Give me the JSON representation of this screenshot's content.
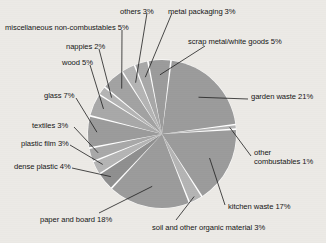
{
  "background_color": "#eceae6",
  "chart_data": {
    "type": "pie",
    "title": "",
    "center": {
      "x": 162,
      "y": 134
    },
    "radius": 74,
    "start_angle_deg": -83,
    "direction": "clockwise",
    "separator_color": "#ffffff",
    "legend": "none (direct labels with leader lines)",
    "categories": [
      "garden waste",
      "other combustables",
      "kitchen waste",
      "soil and other organic material",
      "paper and board",
      "dense plastic",
      "plastic film",
      "textiles",
      "glass",
      "wood",
      "nappies",
      "miscellaneous non-combustables",
      "others",
      "metal packaging",
      "scrap metal/white goods"
    ],
    "values": [
      21,
      1,
      17,
      3,
      18,
      4,
      3,
      3,
      7,
      5,
      2,
      5,
      3,
      3,
      5
    ],
    "units": "%",
    "slice_colors": [
      "#9b9b9b",
      "#b4b4b4",
      "#9b9b9b",
      "#b4b4b4",
      "#9b9b9b",
      "#8f8f8f",
      "#b4b4b4",
      "#a8a8a8",
      "#9b9b9b",
      "#a8a8a8",
      "#b4b4b4",
      "#a2a2a2",
      "#b4b4b4",
      "#a8a8a8",
      "#9b9b9b"
    ],
    "labels": [
      {
        "key": "others",
        "text": "others 3%"
      },
      {
        "key": "metal_packaging",
        "text": "metal packaging 3%"
      },
      {
        "key": "misc_non_combustables",
        "text": "miscellaneous non-combustables 5%"
      },
      {
        "key": "scrap_metal",
        "text": "scrap metal/white goods 5%"
      },
      {
        "key": "nappies",
        "text": "nappies 2%"
      },
      {
        "key": "wood",
        "text": "wood 5%"
      },
      {
        "key": "glass",
        "text": "glass 7%"
      },
      {
        "key": "garden_waste",
        "text": "garden waste 21%"
      },
      {
        "key": "textiles",
        "text": "textiles 3%"
      },
      {
        "key": "plastic_film",
        "text": "plastic film 3%"
      },
      {
        "key": "other_combustables",
        "text": "other combustables 1%"
      },
      {
        "key": "dense_plastic",
        "text": "dense plastic 4%"
      },
      {
        "key": "kitchen_waste",
        "text": "kitchen waste 17%"
      },
      {
        "key": "paper_and_board",
        "text": "paper and board 18%"
      },
      {
        "key": "soil_organic",
        "text": "soil and other organic material 3%"
      }
    ]
  }
}
